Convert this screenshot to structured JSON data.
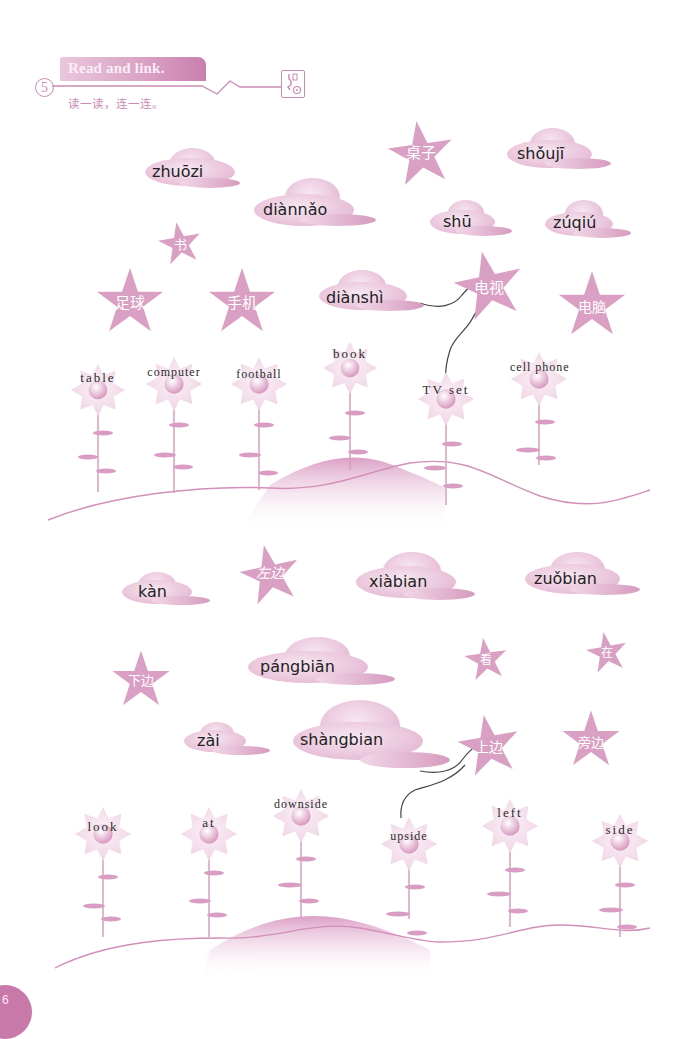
{
  "header": {
    "exercise_number": "5",
    "title": "Read and link.",
    "subtitle": "读一读，连一连。",
    "icon": "listen-cd-icon"
  },
  "colors": {
    "accent_pink": "#d69bbf",
    "star_pink": "#d9a0c4",
    "line_dark": "#444444",
    "text_dark": "#222222"
  },
  "section1": {
    "clouds": [
      {
        "pinyin": "zhuōzi"
      },
      {
        "pinyin": "diànnǎo"
      },
      {
        "pinyin": "shǒujī"
      },
      {
        "pinyin": "shū"
      },
      {
        "pinyin": "zúqiú"
      },
      {
        "pinyin": "diànshì"
      }
    ],
    "stars": [
      {
        "hanzi": "桌子"
      },
      {
        "hanzi": "书"
      },
      {
        "hanzi": "足球"
      },
      {
        "hanzi": "手机"
      },
      {
        "hanzi": "电视"
      },
      {
        "hanzi": "电脑"
      }
    ],
    "flowers": [
      {
        "word": "table"
      },
      {
        "word": "computer"
      },
      {
        "word": "football"
      },
      {
        "word": "book"
      },
      {
        "word": "TV set"
      },
      {
        "word": "cell phone"
      }
    ],
    "example_links": [
      {
        "from": "diànshì",
        "to": "电视"
      },
      {
        "from": "电视",
        "to": "TV set"
      }
    ]
  },
  "section2": {
    "clouds": [
      {
        "pinyin": "kàn"
      },
      {
        "pinyin": "xiàbian"
      },
      {
        "pinyin": "zuǒbian"
      },
      {
        "pinyin": "pángbiān"
      },
      {
        "pinyin": "zài"
      },
      {
        "pinyin": "shàngbian"
      }
    ],
    "stars": [
      {
        "hanzi": "左边"
      },
      {
        "hanzi": "下边"
      },
      {
        "hanzi": "看"
      },
      {
        "hanzi": "在"
      },
      {
        "hanzi": "上边"
      },
      {
        "hanzi": "旁边"
      }
    ],
    "flowers": [
      {
        "word": "look"
      },
      {
        "word": "at"
      },
      {
        "word": "downside"
      },
      {
        "word": "upside"
      },
      {
        "word": "left"
      },
      {
        "word": "side"
      }
    ],
    "example_links": [
      {
        "from": "shàngbian",
        "to": "上边"
      },
      {
        "from": "上边",
        "to": "upside"
      }
    ]
  },
  "footer": {
    "page_number": "6"
  }
}
